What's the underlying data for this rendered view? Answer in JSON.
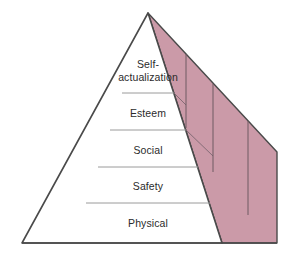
{
  "diagram": {
    "type": "pyramid",
    "background_color": "#ffffff",
    "front_face_color": "#ffffff",
    "side_face_color": "#cb9aa8",
    "outline_color": "#4a4a4a",
    "tier_divider_color": "#9a9a9a",
    "label_color": "#2b2b2b",
    "apex": {
      "x": 148,
      "y": 13
    },
    "front_base_left": {
      "x": 22,
      "y": 243
    },
    "front_base_right": {
      "x": 222,
      "y": 243
    },
    "side_base_right": {
      "x": 277,
      "y": 243
    },
    "side_right_top": {
      "x": 277,
      "y": 152
    },
    "tiers": [
      {
        "id": "tier-self-actualization",
        "label": "Self-\nactualization",
        "order": 1,
        "top_y": 13,
        "bottom_y": 93,
        "label_center_y": 72
      },
      {
        "id": "tier-esteem",
        "label": "Esteem",
        "order": 2,
        "top_y": 93,
        "bottom_y": 130,
        "label_center_y": 114
      },
      {
        "id": "tier-social",
        "label": "Social",
        "order": 3,
        "top_y": 130,
        "bottom_y": 167,
        "label_center_y": 150
      },
      {
        "id": "tier-safety",
        "label": "Safety",
        "order": 4,
        "top_y": 167,
        "bottom_y": 203,
        "label_center_y": 186
      },
      {
        "id": "tier-physical",
        "label": "Physical",
        "order": 5,
        "top_y": 203,
        "bottom_y": 243,
        "label_center_y": 224
      }
    ],
    "side_face_dividers": [
      {
        "id": "side-divider-1",
        "top": {
          "x": 186,
          "y": 70
        },
        "bottom": {
          "x": 186,
          "y": 121
        }
      },
      {
        "id": "side-divider-2",
        "top": {
          "x": 213,
          "y": 92
        },
        "bottom": {
          "x": 213,
          "y": 164
        }
      },
      {
        "id": "side-divider-3",
        "top": {
          "x": 248,
          "y": 120
        },
        "bottom": {
          "x": 248,
          "y": 209
        }
      }
    ]
  }
}
